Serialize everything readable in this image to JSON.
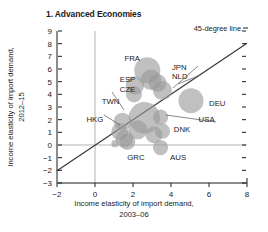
{
  "chart_data": {
    "type": "scatter",
    "title": "1. Advanced Economies",
    "subtitle": "",
    "xlabel_line1": "Income elasticity of import demand,",
    "xlabel_line2": "2003–06",
    "ylabel_line1": "Income elasticity of import demand,",
    "ylabel_line2": "2012–15",
    "xlim": [
      -2,
      8
    ],
    "ylim": [
      -3,
      9
    ],
    "xticks": [
      -2,
      0,
      2,
      4,
      6,
      8
    ],
    "xtick_labels": [
      "−2",
      "0",
      "2",
      "4",
      "6",
      "8"
    ],
    "yticks": [
      -3,
      -2,
      -1,
      0,
      1,
      2,
      3,
      4,
      5,
      6,
      7,
      8,
      9
    ],
    "ytick_labels": [
      "−3",
      "−2",
      "−1",
      "0",
      "1",
      "2",
      "3",
      "4",
      "5",
      "6",
      "7",
      "8",
      "9"
    ],
    "grid": false,
    "legend_position": "top-right",
    "annotations": [
      {
        "name": "45-degree line",
        "label": "45-degree line"
      }
    ],
    "reference_lines": [
      {
        "name": "45-degree line",
        "type": "identity",
        "from": [
          -2,
          -2
        ],
        "to": [
          8,
          8
        ]
      },
      {
        "name": "zero-horizontal",
        "type": "horizontal",
        "y": 0
      },
      {
        "name": "zero-vertical",
        "type": "vertical",
        "x": 0
      }
    ],
    "bubble_color": "#9a9a9a",
    "bubble_opacity": 0.62,
    "points": [
      {
        "label": "FRA",
        "x": 2.75,
        "y": 5.9,
        "size": 26,
        "label_x": 1.55,
        "label_y": 6.6,
        "leader": false
      },
      {
        "label": "ESP",
        "x": 2.1,
        "y": 4.7,
        "size": 13,
        "label_x": 1.3,
        "label_y": 5.0,
        "leader": false
      },
      {
        "label": "CZE",
        "x": 2.05,
        "y": 4.0,
        "size": 10,
        "label_x": 1.3,
        "label_y": 4.2,
        "leader": false
      },
      {
        "label": "JPN",
        "x": 3.55,
        "y": 4.3,
        "size": 14,
        "label_x": 4.05,
        "label_y": 5.9,
        "leader": true
      },
      {
        "label": "NLD",
        "x": 3.3,
        "y": 4.9,
        "size": 12,
        "label_x": 4.05,
        "label_y": 5.2,
        "leader": true
      },
      {
        "label": "DEU",
        "x": 5.05,
        "y": 3.5,
        "size": 24,
        "label_x": 6.0,
        "label_y": 3.1,
        "leader": false
      },
      {
        "label": "USA",
        "x": 3.45,
        "y": 2.2,
        "size": 9,
        "label_x": 5.45,
        "label_y": 1.85,
        "leader": true
      },
      {
        "label": "TWN",
        "x": 1.45,
        "y": 1.85,
        "size": 12,
        "label_x": 0.35,
        "label_y": 3.2,
        "leader": true
      },
      {
        "label": "HKG",
        "x": 1.3,
        "y": 1.05,
        "size": 11,
        "label_x": -0.45,
        "label_y": 1.85,
        "leader": true
      },
      {
        "label": "DNK",
        "x": 3.55,
        "y": 1.1,
        "size": 9,
        "label_x": 4.15,
        "label_y": 1.05,
        "leader": false
      },
      {
        "label": "GRC",
        "x": 1.7,
        "y": 0.25,
        "size": 10,
        "label_x": 1.7,
        "label_y": -1.15,
        "leader": false
      },
      {
        "label": "AUS",
        "x": 3.45,
        "y": -0.2,
        "size": 9,
        "label_x": 3.95,
        "label_y": -1.15,
        "leader": false
      },
      {
        "label": "",
        "x": 2.6,
        "y": 2.15,
        "size": 38,
        "label_x": 0,
        "label_y": 0,
        "leader": false
      },
      {
        "label": "",
        "x": 2.95,
        "y": 5.15,
        "size": 16,
        "label_x": 0,
        "label_y": 0,
        "leader": false
      },
      {
        "label": "",
        "x": 2.25,
        "y": 1.2,
        "size": 14,
        "label_x": 0,
        "label_y": 0,
        "leader": false
      },
      {
        "label": "",
        "x": 1.55,
        "y": 0.5,
        "size": 12,
        "label_x": 0,
        "label_y": 0,
        "leader": false
      },
      {
        "label": "",
        "x": 3.1,
        "y": 0.8,
        "size": 11,
        "label_x": 0,
        "label_y": 0,
        "leader": false
      },
      {
        "label": "",
        "x": 1.05,
        "y": 0.1,
        "size": 2,
        "label_x": 0,
        "label_y": 0,
        "leader": false
      }
    ]
  }
}
